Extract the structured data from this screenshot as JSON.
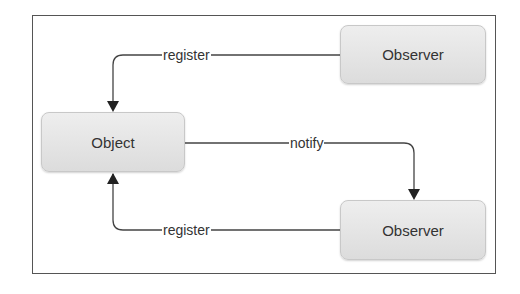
{
  "diagram": {
    "type": "observer-pattern",
    "nodes": [
      {
        "id": "object",
        "label": "Object"
      },
      {
        "id": "observer_top",
        "label": "Observer"
      },
      {
        "id": "observer_bottom",
        "label": "Observer"
      }
    ],
    "edges": [
      {
        "from": "observer_top",
        "to": "object",
        "label": "register"
      },
      {
        "from": "object",
        "to": "observer_bottom",
        "label": "notify"
      },
      {
        "from": "observer_bottom",
        "to": "object",
        "label": "register"
      }
    ]
  },
  "colors": {
    "node_fill_top": "#eeeeee",
    "node_fill_bottom": "#dcdcdc",
    "line": "#444444",
    "frame": "#555555"
  }
}
